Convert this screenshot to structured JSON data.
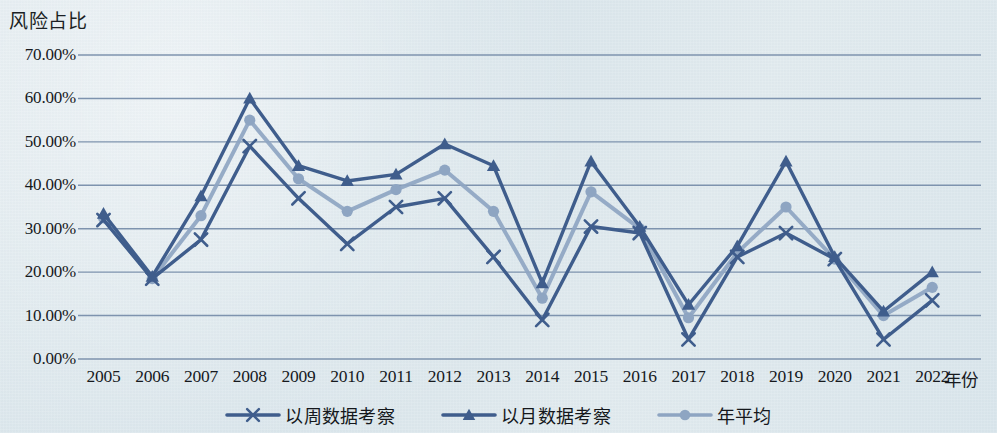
{
  "chart_data": {
    "type": "line",
    "title": "",
    "ylabel": "风险占比",
    "xlabel": "年份",
    "grid": true,
    "legend_position": "bottom",
    "ylim": [
      0,
      70
    ],
    "y_ticks": [
      "0.00%",
      "10.00%",
      "20.00%",
      "30.00%",
      "40.00%",
      "50.00%",
      "60.00%",
      "70.00%"
    ],
    "y_tick_values": [
      0,
      10,
      20,
      30,
      40,
      50,
      60,
      70
    ],
    "categories": [
      "2005",
      "2006",
      "2007",
      "2008",
      "2009",
      "2010",
      "2011",
      "2012",
      "2013",
      "2014",
      "2015",
      "2016",
      "2017",
      "2018",
      "2019",
      "2020",
      "2021",
      "2022"
    ],
    "series": [
      {
        "name": "以周数据考察",
        "marker": "x",
        "color": "#3f5d8c",
        "values": [
          32.0,
          18.5,
          27.5,
          49.0,
          37.0,
          26.5,
          35.0,
          37.0,
          23.5,
          9.0,
          30.5,
          29.0,
          4.5,
          23.5,
          29.0,
          23.0,
          4.5,
          13.5
        ]
      },
      {
        "name": "以月数据考察",
        "marker": "triangle",
        "color": "#3f5d8c",
        "values": [
          33.5,
          19.0,
          37.5,
          60.0,
          44.5,
          41.0,
          42.5,
          49.5,
          44.5,
          17.5,
          45.5,
          30.5,
          12.5,
          26.0,
          45.5,
          23.5,
          11.0,
          20.0
        ]
      },
      {
        "name": "年平均",
        "marker": "circle",
        "color": "#8ea5c2",
        "values": [
          32.5,
          18.5,
          33.0,
          55.0,
          41.5,
          34.0,
          39.0,
          43.5,
          34.0,
          14.0,
          38.5,
          30.0,
          9.5,
          24.5,
          35.0,
          23.0,
          10.0,
          16.5
        ]
      }
    ]
  },
  "legend": {
    "items": [
      {
        "label": "以周数据考察"
      },
      {
        "label": "以月数据考察"
      },
      {
        "label": "年平均"
      }
    ]
  }
}
